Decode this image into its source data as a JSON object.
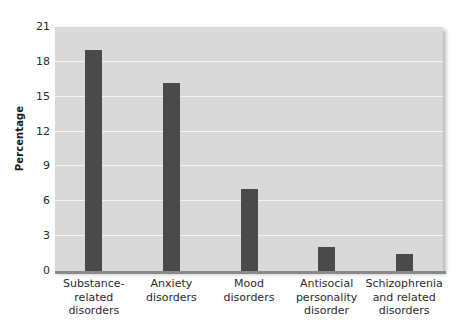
{
  "chart_data": {
    "type": "bar",
    "title": "",
    "xlabel": "",
    "ylabel": "Percentage",
    "ylim": [
      0,
      21
    ],
    "yticks": [
      0,
      3,
      6,
      9,
      12,
      15,
      18,
      21
    ],
    "ytick_labels": [
      "0",
      "3",
      "6",
      "9",
      "12",
      "15",
      "18",
      "21"
    ],
    "grid": "horizontal",
    "gridlines_at": [
      3,
      6,
      9,
      12,
      15,
      18
    ],
    "legend": "none",
    "categories": [
      "Substance-related disorders",
      "Anxiety disorders",
      "Mood disorders",
      "Antisocial personality disorder",
      "Schizophrenia and related disorders"
    ],
    "category_lines": [
      [
        "Substance-",
        "related",
        "disorders"
      ],
      [
        "Anxiety",
        "disorders"
      ],
      [
        "Mood",
        "disorders"
      ],
      [
        "Antisocial",
        "personality",
        "disorder"
      ],
      [
        "Schizophrenia",
        "and related",
        "disorders"
      ]
    ],
    "values": [
      19.0,
      16.2,
      7.1,
      2.1,
      1.5
    ],
    "bar_color": "#4a4a4a",
    "plot_background": "#d9d9d9",
    "gridline_color": "#f4f4f4",
    "page_background": "#ffffff",
    "text_color": "#2b2b2b"
  }
}
